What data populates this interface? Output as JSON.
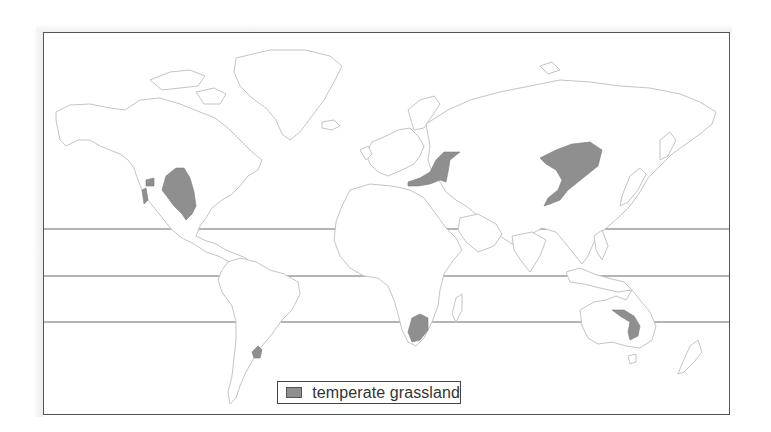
{
  "map": {
    "title": "",
    "type": "world biome distribution map",
    "reference_lines": [
      {
        "name": "tropic-of-cancer",
        "y": 229
      },
      {
        "name": "equator",
        "y": 276
      },
      {
        "name": "tropic-of-capricorn",
        "y": 322
      }
    ],
    "regions": [
      {
        "name": "north-american-prairies",
        "biome": "temperate grassland"
      },
      {
        "name": "great-basin-patch",
        "biome": "temperate grassland"
      },
      {
        "name": "eurasian-steppe-west",
        "biome": "temperate grassland"
      },
      {
        "name": "eurasian-steppe-east",
        "biome": "temperate grassland"
      },
      {
        "name": "pampas",
        "biome": "temperate grassland"
      },
      {
        "name": "south-african-veld",
        "biome": "temperate grassland"
      },
      {
        "name": "australian-grassland",
        "biome": "temperate grassland"
      }
    ],
    "colors": {
      "grassland_fill": "#8f8f8f",
      "coastline": "#c4c4c4",
      "frame": "#555555",
      "lines": "#666666"
    }
  },
  "legend": {
    "items": [
      {
        "label": "temperate grassland",
        "color": "#8f8f8f"
      }
    ]
  }
}
